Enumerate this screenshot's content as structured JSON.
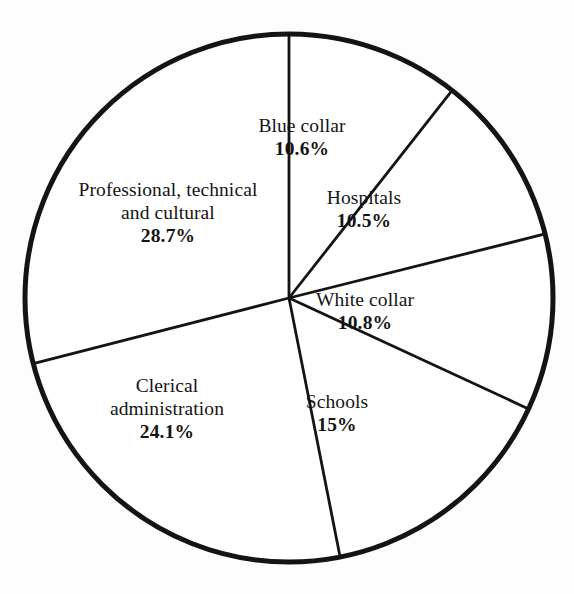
{
  "chart_data": {
    "type": "pie",
    "title": "",
    "subtitle": "",
    "xlabel": "",
    "ylabel": "",
    "legend_position": "none",
    "grid": false,
    "value_unit": "percent",
    "start_angle_deg": 0,
    "direction": "clockwise",
    "categories": [
      "Blue collar",
      "Hospitals",
      "White collar",
      "Schools",
      "Clerical administration",
      "Professional, technical and cultural"
    ],
    "values": [
      10.6,
      10.5,
      10.8,
      15,
      24.1,
      28.7
    ],
    "slices": [
      {
        "name": "blue-collar",
        "lines": [
          "Blue collar"
        ],
        "value": 10.6,
        "value_label": "10.6%",
        "start_deg": 0,
        "end_deg": 38.16,
        "label_x": 302,
        "label_y": 114
      },
      {
        "name": "hospitals",
        "lines": [
          "Hospitals"
        ],
        "value": 10.5,
        "value_label": "10.5%",
        "start_deg": 38.16,
        "end_deg": 75.96,
        "label_x": 364,
        "label_y": 186
      },
      {
        "name": "white-collar",
        "lines": [
          "White collar"
        ],
        "value": 10.8,
        "value_label": "10.8%",
        "start_deg": 75.96,
        "end_deg": 114.84,
        "label_x": 365,
        "label_y": 288
      },
      {
        "name": "schools",
        "lines": [
          "Schools"
        ],
        "value": 15,
        "value_label": "15%",
        "start_deg": 114.84,
        "end_deg": 168.84,
        "label_x": 337,
        "label_y": 390
      },
      {
        "name": "clerical-administration",
        "lines": [
          "Clerical",
          "administration"
        ],
        "value": 24.1,
        "value_label": "24.1%",
        "start_deg": 168.84,
        "end_deg": 255.6,
        "label_x": 167,
        "label_y": 374
      },
      {
        "name": "professional-technical-cultural",
        "lines": [
          "Professional, technical",
          "and cultural"
        ],
        "value": 28.7,
        "value_label": "28.7%",
        "start_deg": 255.6,
        "end_deg": 360,
        "label_x": 168,
        "label_y": 178
      }
    ],
    "geometry": {
      "center_x": 289,
      "center_y": 298,
      "radius": 264,
      "outline_width": 5,
      "divider_width": 2.8
    },
    "colors": {
      "background": "#fdfdfd",
      "stroke": "#141414",
      "slice_fill": "#ffffff",
      "text": "#141414"
    }
  }
}
